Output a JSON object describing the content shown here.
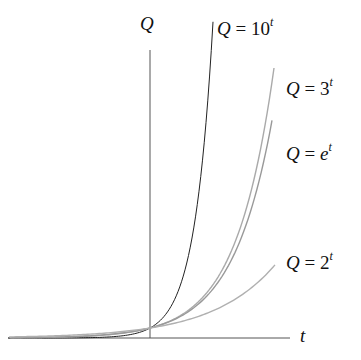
{
  "chart_data": {
    "type": "line",
    "title": "",
    "xlabel": "t",
    "ylabel": "Q",
    "grid": false,
    "legend": "inline labels at curve ends",
    "series": [
      {
        "name": "Q = 10^t",
        "base": "10",
        "color": "#222222",
        "t_range": [
          -3.5,
          1.5
        ]
      },
      {
        "name": "Q = 3^t",
        "base": "3",
        "color": "#aaaaaa",
        "t_range": [
          -3.5,
          3.0
        ]
      },
      {
        "name": "Q = e^t",
        "base": "e",
        "color": "#999999",
        "t_range": [
          -3.5,
          3.08
        ]
      },
      {
        "name": "Q = 2^t",
        "base": "2",
        "color": "#b0b0b0",
        "t_range": [
          -3.5,
          2.87
        ]
      }
    ],
    "annotations": [
      "All curves pass through (0, 1)"
    ]
  },
  "labels": {
    "y_axis": "Q",
    "x_axis": "t",
    "q": "Q",
    "eq": "=",
    "ten": "10",
    "three": "3",
    "e": "e",
    "two": "2",
    "exp": "t"
  }
}
